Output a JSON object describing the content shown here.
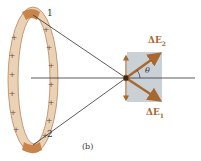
{
  "figure": {
    "caption": "(b)",
    "ring": {
      "segment_labels": [
        "1",
        "2"
      ],
      "charge_symbol": "+",
      "ring_color": "#e8c8a8",
      "segment_color": "#c8844a"
    },
    "vectors": {
      "upper_label": "ΔE",
      "upper_subscript": "2",
      "lower_label": "ΔE",
      "lower_subscript": "1",
      "angle_label": "θ",
      "arrow_color": "#a8672e",
      "box_color": "#c9d0d6"
    }
  }
}
